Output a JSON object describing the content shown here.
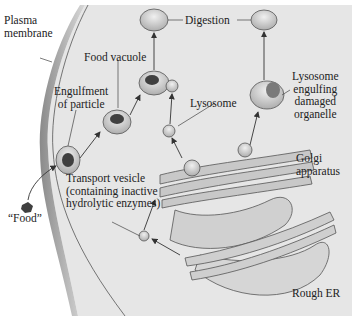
{
  "diagram": {
    "labels": {
      "plasma_membrane": [
        "Plasma",
        "membrane"
      ],
      "food_vacuole": "Food vacuole",
      "digestion": "Digestion",
      "engulfment": [
        "Engulfment",
        "of particle"
      ],
      "lysosome": "Lysosome",
      "lysosome_engulfing": [
        "Lysosome",
        "engulfing",
        "damaged",
        "organelle"
      ],
      "golgi": [
        "Golgi",
        "apparatus"
      ],
      "transport_vesicle": [
        "Transport vesicle",
        "(containing inactive",
        "hydrolytic enzymes)"
      ],
      "food": "“Food”",
      "rough_er": "Rough ER"
    },
    "colors": {
      "cytoplasm": "#e6e6e6",
      "membrane": "#9a9a9a",
      "vesicle": "#d2d2d2",
      "food": "#404040",
      "arrow": "#333333"
    }
  }
}
